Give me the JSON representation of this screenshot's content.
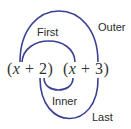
{
  "diagram": {
    "binomials": [
      {
        "open": "(",
        "variable": "x",
        "operator": " + ",
        "constant": "2",
        "close": ")"
      },
      {
        "open": "(",
        "variable": "x",
        "operator": " + ",
        "constant": "3",
        "close": ")"
      }
    ],
    "labels": {
      "first": "First",
      "outer": "Outer",
      "inner": "Inner",
      "last": "Last"
    },
    "colors": {
      "arc": "#3b4192",
      "text": "#2a2a2a"
    }
  }
}
